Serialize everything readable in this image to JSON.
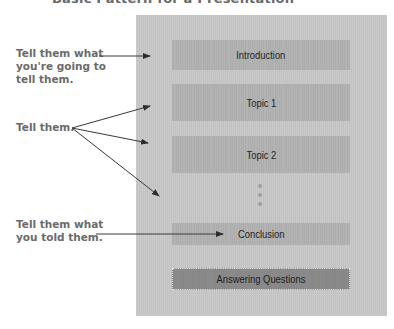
{
  "title": "Basic Pattern for a Presentation",
  "colors": {
    "panel": "#c6c6c6",
    "box": "#b0b0b0",
    "box_emphasis": "#898989",
    "label_text": "#6b6b6b",
    "arrow": "#333333"
  },
  "annotations": [
    {
      "id": "preview",
      "lines": [
        "Tell them what",
        "you're going to",
        "tell them."
      ]
    },
    {
      "id": "body",
      "lines": [
        "Tell them."
      ]
    },
    {
      "id": "recap",
      "lines": [
        "Tell them what",
        "you told them."
      ]
    }
  ],
  "sections": [
    {
      "label": "Introduction"
    },
    {
      "label": "Topic 1"
    },
    {
      "label": "Topic 2"
    },
    {
      "label": "Conclusion"
    },
    {
      "label": "Answering Questions"
    }
  ],
  "ellipsis": "continuation dots (3)"
}
